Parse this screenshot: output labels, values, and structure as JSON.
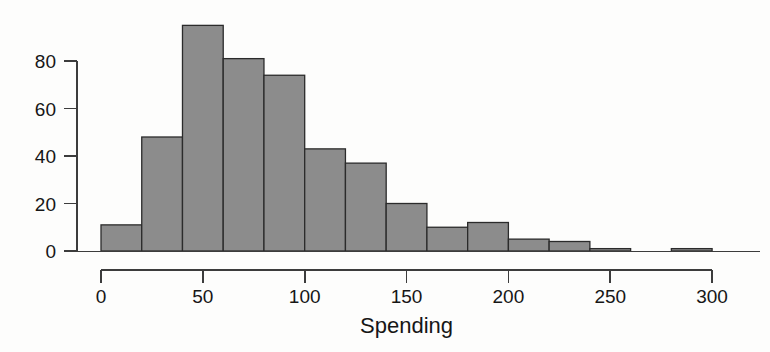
{
  "chart_data": {
    "type": "bar",
    "title": "",
    "subtitle": "",
    "xlabel": "Spending",
    "ylabel": "",
    "bin_width": 20,
    "bin_edges": [
      0,
      20,
      40,
      60,
      80,
      100,
      120,
      140,
      160,
      180,
      200,
      220,
      240,
      260,
      280,
      300
    ],
    "categories": [
      "0-20",
      "20-40",
      "40-60",
      "60-80",
      "80-100",
      "100-120",
      "120-140",
      "140-160",
      "160-180",
      "180-200",
      "200-220",
      "220-240",
      "240-260",
      "260-280",
      "280-300"
    ],
    "values": [
      11,
      48,
      95,
      81,
      74,
      43,
      37,
      20,
      10,
      12,
      5,
      4,
      1,
      0,
      1
    ],
    "xlim": [
      0,
      300
    ],
    "ylim": [
      0,
      96
    ],
    "xticks": [
      0,
      50,
      100,
      150,
      200,
      250,
      300
    ],
    "xtick_labels": [
      "0",
      "50",
      "100",
      "150",
      "200",
      "250",
      "300"
    ],
    "yticks": [
      0,
      20,
      40,
      60,
      80
    ],
    "ytick_labels": [
      "0",
      "20",
      "40",
      "60",
      "80"
    ],
    "grid": false,
    "legend": null,
    "bar_fill_color": "#8c8c8c",
    "bar_edge_color": "#2b2b2b",
    "axis_color": "#3c3c3c",
    "background_color": "#fdfdfc"
  },
  "figure": {
    "xlabel": "Spending"
  }
}
